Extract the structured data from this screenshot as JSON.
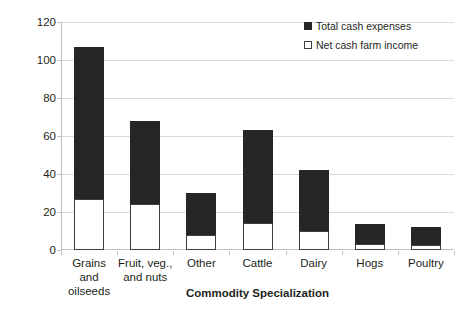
{
  "chart_data": {
    "type": "bar",
    "stacked": true,
    "title": "",
    "xlabel": "Commodity Specialization",
    "ylabel": "$ Billions",
    "ylim": [
      0,
      120
    ],
    "ytick_step": 20,
    "yticks": [
      120,
      100,
      80,
      60,
      40,
      20,
      0
    ],
    "grid": true,
    "legend_position": "top-right",
    "categories": [
      "Grains and oilseeds",
      "Fruit, veg., and nuts",
      "Other",
      "Cattle",
      "Dairy",
      "Hogs",
      "Poultry"
    ],
    "category_lines": [
      [
        "Grains and",
        "oilseeds"
      ],
      [
        "Fruit, veg.,",
        "and nuts"
      ],
      [
        "Other"
      ],
      [
        "Cattle"
      ],
      [
        "Dairy"
      ],
      [
        "Hogs"
      ],
      [
        "Poultry"
      ]
    ],
    "series": [
      {
        "name": "Total cash expenses",
        "color": "#262626",
        "values": [
          107,
          68,
          30,
          63,
          42,
          13.5,
          12
        ]
      },
      {
        "name": "Net cash farm income",
        "color": "#ffffff",
        "values": [
          27,
          24,
          8,
          14,
          10,
          3,
          2.5
        ]
      }
    ]
  },
  "legend": {
    "items": [
      {
        "label": "Total cash expenses",
        "swatch": "filled-square-icon"
      },
      {
        "label": "Net cash farm income",
        "swatch": "hollow-square-icon"
      }
    ]
  },
  "axes": {
    "y_title": "$ Billions",
    "x_title": "Commodity Specialization",
    "y_tick_labels": [
      "120",
      "100",
      "80",
      "60",
      "40",
      "20",
      "0"
    ]
  }
}
